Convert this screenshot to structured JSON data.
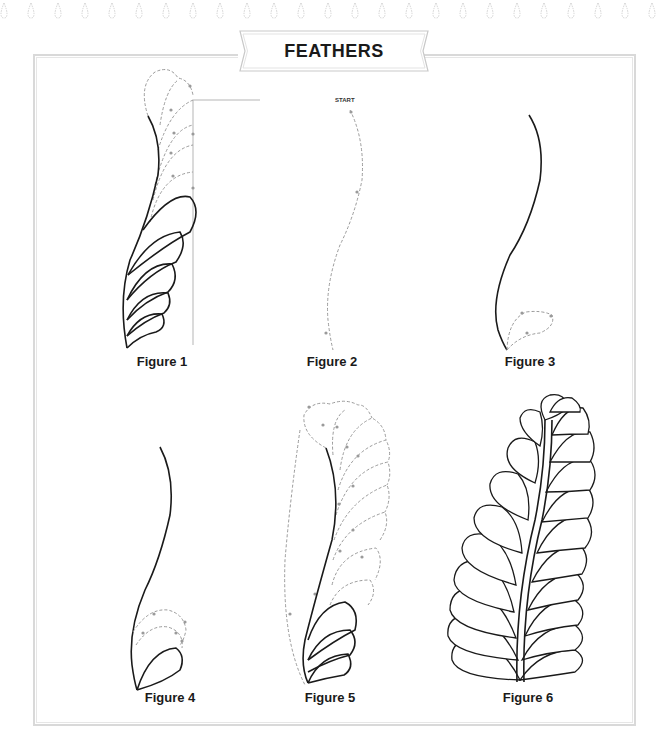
{
  "page": {
    "title": "FEATHERS",
    "decoration": "droplet-border-row"
  },
  "figures": [
    {
      "id": 1,
      "caption": "Figure 1",
      "description": "Feather with solid spine and five solid lower plumes, dashed upper plumes and vertical guide line"
    },
    {
      "id": 2,
      "caption": "Figure 2",
      "description": "Dashed S-curve spine path with START marker",
      "start_label": "START"
    },
    {
      "id": 3,
      "caption": "Figure 3",
      "description": "Solid S-curve spine with first dashed plume at base"
    },
    {
      "id": 4,
      "caption": "Figure 4",
      "description": "Solid spine with first solid plume and dashed plumes stacking upward"
    },
    {
      "id": 5,
      "caption": "Figure 5",
      "description": "Spine with three solid lower plumes and dashed plumes continuing up both sides"
    },
    {
      "id": 6,
      "caption": "Figure 6",
      "description": "Completed double-sided feather with plumes on both sides of a double-line spine"
    }
  ],
  "colors": {
    "line": "#1a1a1a",
    "dash": "#9a9a9a",
    "frame": "#d9d9d9"
  }
}
